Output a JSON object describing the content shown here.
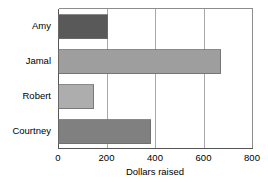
{
  "chart_data": {
    "type": "bar",
    "orientation": "horizontal",
    "title": "",
    "xlabel": "Dollars raised",
    "ylabel": "",
    "categories": [
      "Amy",
      "Jamal",
      "Robert",
      "Courtney"
    ],
    "values": [
      200,
      670,
      145,
      380
    ],
    "series": [
      {
        "name": "Dollars raised",
        "values": [
          200,
          670,
          145,
          380
        ]
      }
    ],
    "xlim": [
      0,
      800
    ],
    "xticks": [
      0,
      200,
      400,
      600,
      800
    ],
    "xtick_labels": [
      "0",
      "200",
      "400",
      "600",
      "800"
    ],
    "grid": "vertical",
    "legend": "none",
    "bar_colors": [
      "#595959",
      "#9e9e9e",
      "#adadad",
      "#808080"
    ],
    "bar_edge_color": "#6b6b6b",
    "grid_color": "#a8a8a8",
    "frame_color": "#8c8c8c",
    "background": "#ffffff"
  },
  "geometry": {
    "plot_left": 58,
    "plot_right": 252,
    "plot_top": 8,
    "plot_bottom": 148,
    "band_height": 35,
    "bar_height": 24
  }
}
